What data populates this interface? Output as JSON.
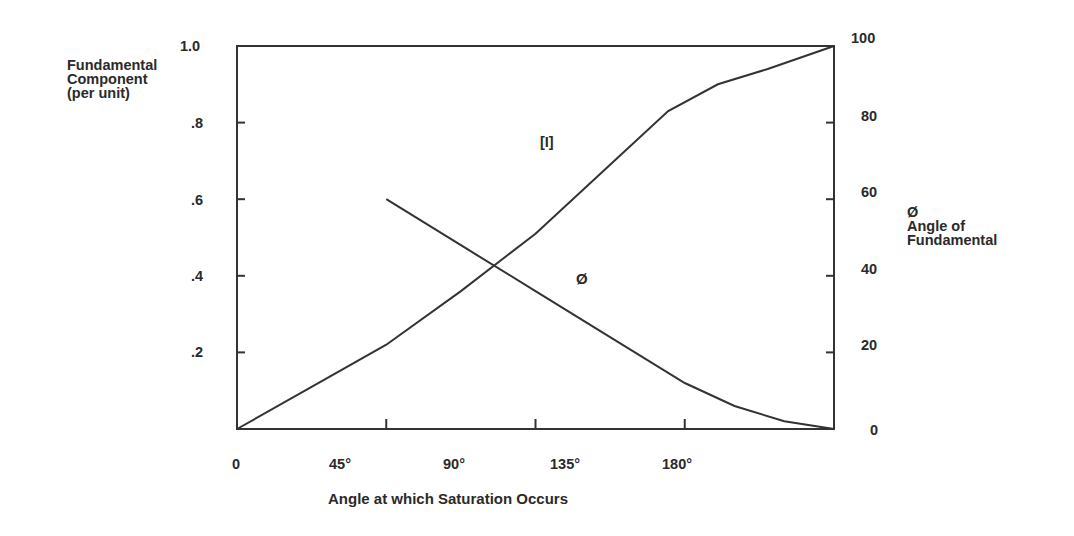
{
  "chart_data": {
    "type": "line",
    "title": "",
    "xlabel": "Angle at which Saturation Occurs",
    "ylabel_left": [
      "Fundamental",
      "Component",
      "(per unit)"
    ],
    "ylabel_right": [
      "Ø",
      "Angle of",
      "Fundamental"
    ],
    "x_ticks": [
      "0",
      "45°",
      "90°",
      "135°",
      "180°"
    ],
    "y_left_ticks": [
      "1.0",
      ".8",
      ".6",
      ".4",
      ".2"
    ],
    "y_right_ticks": [
      "100",
      "80",
      "60",
      "40",
      "20",
      "0"
    ],
    "xlim": [
      0,
      180
    ],
    "ylim_left": [
      0,
      1.0
    ],
    "ylim_right": [
      0,
      100
    ],
    "grid": false,
    "series": [
      {
        "name": "[I]",
        "axis": "left",
        "x": [
          0,
          22.5,
          45,
          67.5,
          90,
          112.5,
          130,
          145,
          160,
          180
        ],
        "values": [
          0,
          0.11,
          0.22,
          0.36,
          0.51,
          0.69,
          0.83,
          0.9,
          0.94,
          1.0
        ]
      },
      {
        "name": "Ø",
        "axis": "right",
        "x": [
          45,
          67.5,
          90,
          112.5,
          135,
          150,
          165,
          180
        ],
        "values": [
          60,
          48,
          36,
          24,
          12,
          6,
          2,
          0
        ]
      }
    ],
    "annotations": [
      {
        "text": "[I]",
        "x": 103,
        "y_left": 0.755
      },
      {
        "text": "Ø",
        "x": 103,
        "y_left": 0.385
      }
    ]
  },
  "labels": {
    "curve_i": "[I]",
    "curve_phi": "Ø"
  }
}
